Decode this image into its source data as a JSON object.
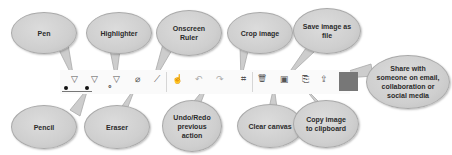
{
  "callouts": {
    "pen": "Pen",
    "highlighter": "Highlighter",
    "ruler_l1": "Onscreen",
    "ruler_l2": "Ruler",
    "crop": "Crop image",
    "save_l1": "Save image as",
    "save_l2": "file",
    "share_l1": "Share with",
    "share_l2": "someone on email,",
    "share_l3": "collaboration or",
    "share_l4": "social media",
    "pencil": "Pencil",
    "eraser": "Eraser",
    "undo_l1": "Undo/Redo",
    "undo_l2": "previous",
    "undo_l3": "action",
    "clear": "Clear canvas",
    "copy_l1": "Copy image",
    "copy_l2": "to clipboard"
  },
  "toolbar": {
    "icons": {
      "pen": "▽",
      "pencil": "▽",
      "highlighter": "▽",
      "eraser": "⌀",
      "ruler": "⟋",
      "touch": "☝",
      "undo": "↶",
      "redo": "↷",
      "crop": "⌗",
      "clear": "🗑",
      "save": "▣",
      "copy": "⎘",
      "share": "⇪",
      "pen_color_dot": "●",
      "small_dot": "∘"
    },
    "colors": {
      "accent_box": "#777777"
    }
  }
}
